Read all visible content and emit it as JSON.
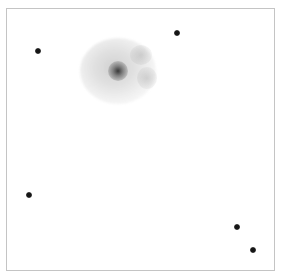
{
  "image": {
    "description": "Inverted grayscale astronomical field: diffuse galaxy/nebula with five point-like stars",
    "width": 283,
    "height": 274,
    "background_color": "#ffffff",
    "frame_color": "#c4c4c4",
    "foreground_color": "#111111"
  },
  "nebula": {
    "center_x": 117,
    "center_y": 70,
    "radius_x": 38,
    "radius_y": 33,
    "core_radius": 9
  },
  "stars": [
    {
      "id": "star-1",
      "x": 37,
      "y": 50,
      "size": 5
    },
    {
      "id": "star-2",
      "x": 176,
      "y": 32,
      "size": 5
    },
    {
      "id": "star-3",
      "x": 28,
      "y": 194,
      "size": 5
    },
    {
      "id": "star-4",
      "x": 236,
      "y": 226,
      "size": 5
    },
    {
      "id": "star-5",
      "x": 252,
      "y": 249,
      "size": 5
    }
  ]
}
